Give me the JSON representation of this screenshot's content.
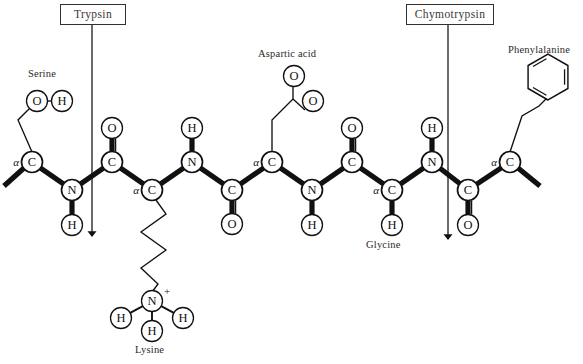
{
  "figure": {
    "background_color": "#ffffff",
    "line_color": "#111111",
    "box_border_color": "#33312f"
  },
  "enzymes": [
    {
      "name": "trypsin-label",
      "label": "Trypsin",
      "box": {
        "x": 60,
        "y": 4,
        "w": 66,
        "h": 21
      },
      "arrow": {
        "x": 92,
        "y_start": 25,
        "y_end": 234
      },
      "cleaves_after": "Lysine"
    },
    {
      "name": "chymotrypsin-label",
      "label": "Chymotrypsin",
      "box": {
        "x": 406,
        "y": 4,
        "w": 88,
        "h": 21
      },
      "arrow": {
        "x": 448,
        "y_start": 25,
        "y_end": 237
      },
      "cleaves_after": "Glycine"
    }
  ],
  "residue_labels": [
    {
      "name": "serine-label",
      "text": "Serine",
      "x": 28,
      "y": 68
    },
    {
      "name": "aspartic-acid-label",
      "text": "Aspartic acid",
      "x": 258,
      "y": 48
    },
    {
      "name": "phenylalanine-label",
      "text": "Phenylalanine",
      "x": 508,
      "y": 44
    },
    {
      "name": "lysine-label",
      "text": "Lysine",
      "x": 135,
      "y": 344
    },
    {
      "name": "glycine-label",
      "text": "Glycine",
      "x": 366,
      "y": 239
    }
  ],
  "backbone_atoms": [
    {
      "name": "serine-alpha-carbon",
      "symbol": "C",
      "alpha": true,
      "x": 32,
      "y": 162
    },
    {
      "name": "backbone-nitrogen-1",
      "symbol": "N",
      "alpha": false,
      "x": 72,
      "y": 190
    },
    {
      "name": "backbone-carbonyl-carbon-1",
      "symbol": "C",
      "alpha": false,
      "x": 112,
      "y": 162
    },
    {
      "name": "lysine-alpha-carbon",
      "symbol": "C",
      "alpha": true,
      "x": 152,
      "y": 190
    },
    {
      "name": "backbone-nitrogen-2",
      "symbol": "N",
      "alpha": false,
      "x": 192,
      "y": 162
    },
    {
      "name": "backbone-carbonyl-carbon-2",
      "symbol": "C",
      "alpha": false,
      "x": 232,
      "y": 190
    },
    {
      "name": "aspartate-alpha-carbon",
      "symbol": "C",
      "alpha": true,
      "x": 272,
      "y": 162
    },
    {
      "name": "backbone-nitrogen-3",
      "symbol": "N",
      "alpha": false,
      "x": 312,
      "y": 190
    },
    {
      "name": "backbone-carbonyl-carbon-3",
      "symbol": "C",
      "alpha": false,
      "x": 352,
      "y": 162
    },
    {
      "name": "glycine-alpha-carbon",
      "symbol": "C",
      "alpha": true,
      "x": 392,
      "y": 190
    },
    {
      "name": "backbone-nitrogen-4",
      "symbol": "N",
      "alpha": false,
      "x": 432,
      "y": 162
    },
    {
      "name": "backbone-carbonyl-carbon-4",
      "symbol": "C",
      "alpha": false,
      "x": 468,
      "y": 190
    },
    {
      "name": "phenylalanine-alpha-carbon",
      "symbol": "C",
      "alpha": true,
      "x": 510,
      "y": 162
    }
  ],
  "substituent_atoms": [
    {
      "name": "amide-hydrogen-1",
      "symbol": "H",
      "x": 72,
      "y": 225
    },
    {
      "name": "carbonyl-oxygen-1",
      "symbol": "O",
      "x": 112,
      "y": 128
    },
    {
      "name": "amide-hydrogen-2",
      "symbol": "H",
      "x": 192,
      "y": 128
    },
    {
      "name": "carbonyl-oxygen-2",
      "symbol": "O",
      "x": 232,
      "y": 224
    },
    {
      "name": "amide-hydrogen-3",
      "symbol": "H",
      "x": 312,
      "y": 225
    },
    {
      "name": "carbonyl-oxygen-3",
      "symbol": "O",
      "x": 352,
      "y": 128
    },
    {
      "name": "glycine-hydrogen",
      "symbol": "H",
      "x": 392,
      "y": 225
    },
    {
      "name": "amide-hydrogen-4",
      "symbol": "H",
      "x": 432,
      "y": 128
    },
    {
      "name": "carbonyl-oxygen-4",
      "symbol": "O",
      "x": 468,
      "y": 225
    },
    {
      "name": "serine-hydroxyl-oxygen",
      "symbol": "O",
      "x": 37,
      "y": 101
    },
    {
      "name": "serine-hydroxyl-hydrogen",
      "symbol": "H",
      "x": 62,
      "y": 101
    },
    {
      "name": "aspartate-carbonyl-oxygen",
      "symbol": "O",
      "x": 294,
      "y": 76
    },
    {
      "name": "aspartate-hydroxyl-oxygen",
      "symbol": "O",
      "x": 313,
      "y": 101
    },
    {
      "name": "lysine-ammonium-nitrogen",
      "symbol": "N",
      "x": 152,
      "y": 301,
      "charge": "+"
    },
    {
      "name": "lysine-ammonium-hydrogen-left",
      "symbol": "H",
      "x": 121,
      "y": 318
    },
    {
      "name": "lysine-ammonium-hydrogen-right",
      "symbol": "H",
      "x": 183,
      "y": 318
    },
    {
      "name": "lysine-ammonium-hydrogen-bottom",
      "symbol": "H",
      "x": 152,
      "y": 331
    }
  ],
  "side_chains": {
    "serine": {
      "name": "serine-side-chain",
      "path": "M32,152 L18,120 L30,108"
    },
    "lysine": {
      "name": "lysine-side-chain",
      "path": "M156,200 L166,214 L141,232 L166,250 L141,268 L158,284 L152,292"
    },
    "aspartate": {
      "name": "aspartate-side-chain",
      "path": "M272,152 L272,120 L293,99 L293,86"
    },
    "aspartate_second_bond": {
      "name": "aspartate-second-bond",
      "path": "M293,99 L305,110"
    },
    "phenylalanine": {
      "name": "phenylalanine-side-chain",
      "path": "M510,152 L522,116 L539,106 L546,99"
    },
    "benzene_ring": {
      "name": "benzene-ring",
      "cx": 548,
      "cy": 77,
      "r": 23
    }
  },
  "chain_termini": [
    {
      "name": "n-terminus-bond",
      "path": "M24,168 L4,186"
    },
    {
      "name": "c-terminus-bond",
      "path": "M518,168 L540,186"
    }
  ],
  "atom_radius": 10.5
}
